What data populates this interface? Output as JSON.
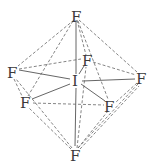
{
  "diagram": {
    "type": "molecular-geometry",
    "central_atom": {
      "label": "I",
      "x": 76,
      "y": 80
    },
    "atoms": [
      {
        "id": "top",
        "label": "F",
        "x": 76,
        "y": 15
      },
      {
        "id": "left",
        "label": "F",
        "x": 13,
        "y": 72
      },
      {
        "id": "back",
        "label": "F",
        "x": 87,
        "y": 61
      },
      {
        "id": "right",
        "label": "F",
        "x": 141,
        "y": 78
      },
      {
        "id": "front_left",
        "label": "F",
        "x": 25,
        "y": 102
      },
      {
        "id": "front_right",
        "label": "F",
        "x": 110,
        "y": 106
      },
      {
        "id": "bottom",
        "label": "F",
        "x": 75,
        "y": 155
      }
    ],
    "bond_color": "#555555",
    "edge_color": "#666666"
  }
}
